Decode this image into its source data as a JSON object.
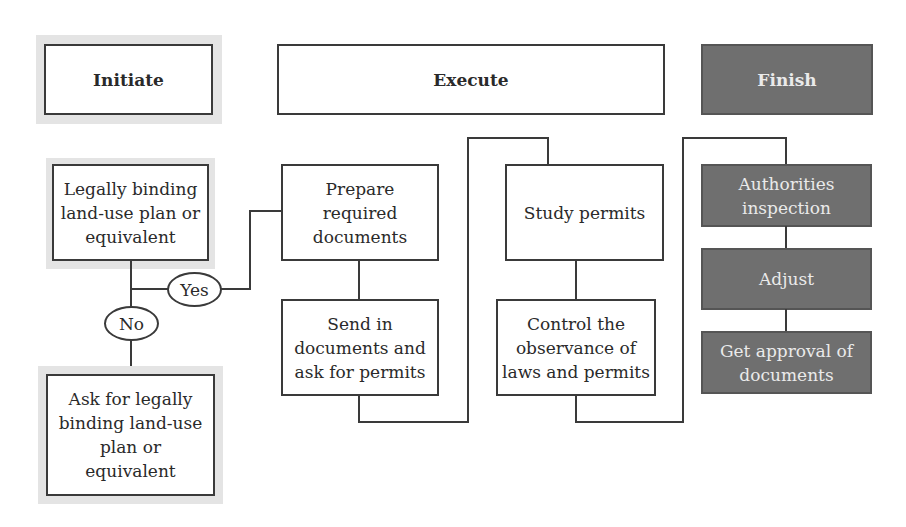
{
  "phases": {
    "initiate": "Initiate",
    "execute": "Execute",
    "finish": "Finish"
  },
  "initiate_steps": {
    "condition": "Legally binding\nland-use plan or\nequivalent",
    "yes_label": "Yes",
    "no_label": "No",
    "ask": "Ask for legally\nbinding land-use\nplan or\nequivalent"
  },
  "execute_steps": {
    "prepare": "Prepare\nrequired\ndocuments",
    "send": "Send in\ndocuments and\nask for permits",
    "study": "Study permits",
    "control": "Control the\nobservance of\nlaws and permits"
  },
  "finish_steps": {
    "inspection": "Authorities\ninspection",
    "adjust": "Adjust",
    "approval": "Get approval of\ndocuments"
  },
  "colors": {
    "finish_fill": "#6f6f6f",
    "shade": "#e4e4e4",
    "line": "#3a3a3a"
  }
}
